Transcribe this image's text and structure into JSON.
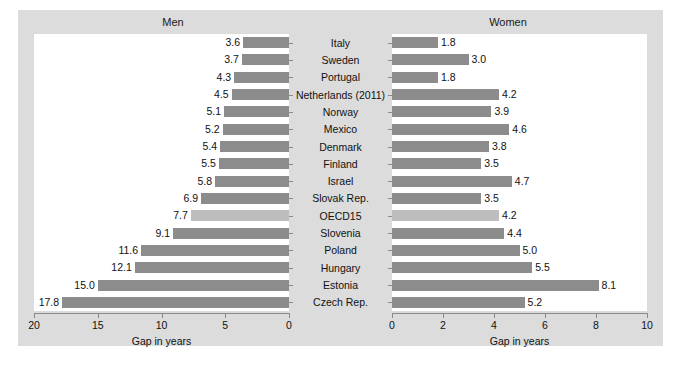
{
  "figure": {
    "background_color": "#dcdcdc",
    "panel_background_color": "#ffffff",
    "bar_color": "#8c8c8c",
    "highlight_bar_color": "#bdbdbd"
  },
  "panels": {
    "left_title": "Men",
    "right_title": "Women"
  },
  "chart_data": {
    "type": "bar",
    "title": "",
    "orientation": "horizontal",
    "grid": false,
    "legend": null,
    "categories": [
      "Italy",
      "Sweden",
      "Portugal",
      "Netherlands (2011)",
      "Norway",
      "Mexico",
      "Denmark",
      "Finland",
      "Israel",
      "Slovak Rep.",
      "OECD15",
      "Slovenia",
      "Poland",
      "Hungary",
      "Estonia",
      "Czech Rep."
    ],
    "highlight_category": "OECD15",
    "series": [
      {
        "name": "Men",
        "panel": "left",
        "xlabel": "Gap in years",
        "ylabel": "",
        "xlim": [
          20,
          0
        ],
        "reversed": true,
        "ticks": [
          20,
          15,
          10,
          5,
          0
        ],
        "tick_labels": [
          "20",
          "15",
          "10",
          "5",
          "0"
        ],
        "values": [
          3.6,
          3.7,
          4.3,
          4.5,
          5.1,
          5.2,
          5.4,
          5.5,
          5.8,
          6.9,
          7.7,
          9.1,
          11.6,
          12.1,
          15.0,
          17.8
        ],
        "value_labels": [
          "3.6",
          "3.7",
          "4.3",
          "4.5",
          "5.1",
          "5.2",
          "5.4",
          "5.5",
          "5.8",
          "6.9",
          "7.7",
          "9.1",
          "11.6",
          "12.1",
          "15.0",
          "17.8"
        ]
      },
      {
        "name": "Women",
        "panel": "right",
        "xlabel": "Gap in years",
        "ylabel": "",
        "xlim": [
          0,
          10
        ],
        "reversed": false,
        "ticks": [
          0,
          2,
          4,
          6,
          8,
          10
        ],
        "tick_labels": [
          "0",
          "2",
          "4",
          "6",
          "8",
          "10"
        ],
        "values": [
          1.8,
          3.0,
          1.8,
          4.2,
          3.9,
          4.6,
          3.8,
          3.5,
          4.7,
          3.5,
          4.2,
          4.4,
          5.0,
          5.5,
          8.1,
          5.2
        ],
        "value_labels": [
          "1.8",
          "3.0",
          "1.8",
          "4.2",
          "3.9",
          "4.6",
          "3.8",
          "3.5",
          "4.7",
          "3.5",
          "4.2",
          "4.4",
          "5.0",
          "5.5",
          "8.1",
          "5.2"
        ]
      }
    ]
  }
}
